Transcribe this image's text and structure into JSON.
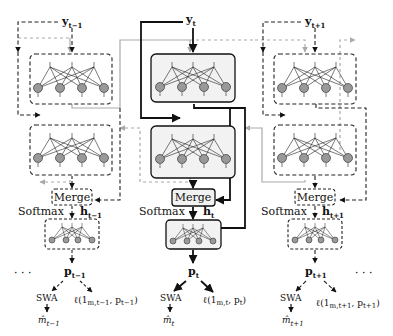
{
  "diagram": {
    "type": "neural-network-architecture",
    "colors": {
      "active_path": "#111111",
      "inactive_dashed": "#222222",
      "grey_path": "#aaaaaa",
      "node_fill": "#999999",
      "box_fill_active": "#f2f2f2"
    },
    "columns": [
      {
        "id": "t-1",
        "active": false,
        "input_label": "y",
        "input_sub": "t−1",
        "merge_label": "Merge",
        "softmax_label": "Softmax",
        "hidden_label": "h",
        "hidden_sub": "t−1",
        "output_label": "p",
        "output_sub": "t−1",
        "swa_label": "SWA",
        "estimate_label": "m̂",
        "estimate_sub": "t−1",
        "loss_label": "ℓ(1",
        "loss_sub": "m,t−1",
        "loss_rest": ", p",
        "loss_rest_sub": "t−1",
        "loss_close": ")"
      },
      {
        "id": "t",
        "active": true,
        "input_label": "y",
        "input_sub": "t",
        "merge_label": "Merge",
        "softmax_label": "Softmax",
        "hidden_label": "h",
        "hidden_sub": "t",
        "output_label": "p",
        "output_sub": "t",
        "swa_label": "SWA",
        "estimate_label": "m̂",
        "estimate_sub": "t",
        "loss_label": "ℓ(1",
        "loss_sub": "m,t",
        "loss_rest": ", p",
        "loss_rest_sub": "t",
        "loss_close": ")"
      },
      {
        "id": "t+1",
        "active": false,
        "input_label": "y",
        "input_sub": "t+1",
        "merge_label": "Merge",
        "softmax_label": "Softmax",
        "hidden_label": "h",
        "hidden_sub": "t+1",
        "output_label": "p",
        "output_sub": "t+1",
        "swa_label": "SWA",
        "estimate_label": "m̂",
        "estimate_sub": "t+1",
        "loss_label": "ℓ(1",
        "loss_sub": "m,t+1",
        "loss_rest": ", p",
        "loss_rest_sub": "t+1",
        "loss_close": ")"
      }
    ],
    "ellipsis_left": "· · ·",
    "ellipsis_right": "· · ·"
  }
}
